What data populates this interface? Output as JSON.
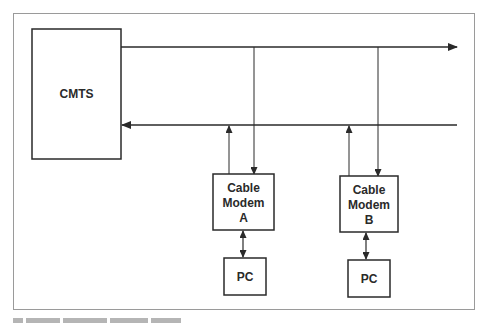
{
  "diagram": {
    "nodes": {
      "cmts": {
        "label": "CMTS"
      },
      "modem_a": {
        "line1": "Cable",
        "line2": "Modem",
        "line3": "A"
      },
      "modem_b": {
        "line1": "Cable",
        "line2": "Modem",
        "line3": "B"
      },
      "pc_a": {
        "label": "PC"
      },
      "pc_b": {
        "label": "PC"
      }
    },
    "edges": [
      {
        "from": "cmts",
        "to": "right",
        "direction": "downstream"
      },
      {
        "from": "right",
        "to": "cmts",
        "direction": "upstream"
      },
      {
        "from": "downstream-bus",
        "to": "modem_a"
      },
      {
        "from": "modem_a",
        "to": "upstream-bus"
      },
      {
        "from": "downstream-bus",
        "to": "modem_b"
      },
      {
        "from": "modem_b",
        "to": "upstream-bus"
      },
      {
        "from": "modem_a",
        "to": "pc_a",
        "bidirectional": true
      },
      {
        "from": "modem_b",
        "to": "pc_b",
        "bidirectional": true
      }
    ],
    "colors": {
      "stroke": "#2a2a2a",
      "frame": "#9a9a9a",
      "background": "#ffffff"
    }
  }
}
